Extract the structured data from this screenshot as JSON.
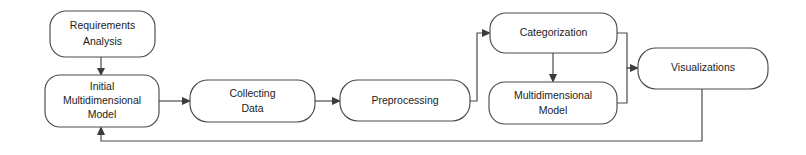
{
  "diagram": {
    "type": "flowchart",
    "orientation": "left-to-right",
    "background_color": "#ffffff",
    "stroke_color": "#4a4a4a",
    "text_color": "#1c1c1c",
    "nodes": [
      {
        "id": "requirements-analysis",
        "shape": "rounded-rectangle",
        "lines": [
          "Requirements",
          "Analysis"
        ],
        "x": 50,
        "y": 11,
        "w": 105,
        "h": 46
      },
      {
        "id": "initial-multidimensional-model",
        "shape": "rounded-rectangle",
        "lines": [
          "Initial",
          "Multidimensional",
          "Model"
        ],
        "x": 45,
        "y": 75,
        "w": 114,
        "h": 52
      },
      {
        "id": "collecting-data",
        "shape": "rounded-rectangle",
        "lines": [
          "Collecting",
          "Data"
        ],
        "x": 190,
        "y": 80,
        "w": 125,
        "h": 42
      },
      {
        "id": "preprocessing",
        "shape": "rounded-rectangle",
        "lines": [
          "Preprocessing"
        ],
        "x": 340,
        "y": 80,
        "w": 130,
        "h": 41
      },
      {
        "id": "categorization",
        "shape": "rounded-rectangle",
        "lines": [
          "Categorization"
        ],
        "x": 490,
        "y": 13,
        "w": 127,
        "h": 40
      },
      {
        "id": "multidimensional-model",
        "shape": "rounded-rectangle",
        "lines": [
          "Multidimensional",
          "Model"
        ],
        "x": 489,
        "y": 82,
        "w": 128,
        "h": 42
      },
      {
        "id": "visualizations",
        "shape": "rounded-rectangle",
        "lines": [
          "Visualizations"
        ],
        "x": 638,
        "y": 48,
        "w": 130,
        "h": 41
      }
    ],
    "edges": [
      {
        "id": "requirements-to-initial-model",
        "from": "requirements-analysis",
        "to": "initial-multidimensional-model",
        "direction": "down",
        "arrow": true
      },
      {
        "id": "initial-model-to-collecting-data",
        "from": "initial-multidimensional-model",
        "to": "collecting-data",
        "direction": "right",
        "arrow": true
      },
      {
        "id": "collecting-data-to-preprocessing",
        "from": "collecting-data",
        "to": "preprocessing",
        "direction": "right",
        "arrow": true
      },
      {
        "id": "preprocessing-to-categorization",
        "from": "preprocessing",
        "to": "categorization",
        "direction": "right-up-right",
        "arrow": true
      },
      {
        "id": "categorization-to-multidimensional-model",
        "from": "categorization",
        "to": "multidimensional-model",
        "direction": "down",
        "arrow": true
      },
      {
        "id": "categorization-to-visualizations",
        "from": "categorization",
        "to": "visualizations",
        "direction": "right-down-right",
        "arrow": true
      },
      {
        "id": "multidimensional-model-to-visualizations",
        "from": "multidimensional-model",
        "to": "visualizations",
        "direction": "right-up-right",
        "arrow": true
      },
      {
        "id": "visualizations-feedback-to-initial-model",
        "from": "visualizations",
        "to": "initial-multidimensional-model",
        "direction": "down-left-up",
        "arrow": true,
        "label": "feedback loop"
      }
    ]
  }
}
